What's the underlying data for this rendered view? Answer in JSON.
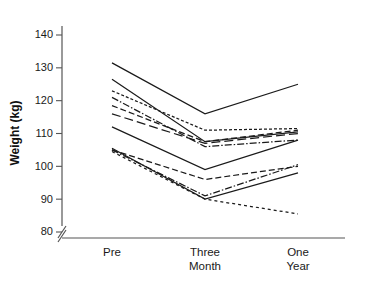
{
  "chart_data": {
    "type": "line",
    "title": "",
    "subtitle": "",
    "xlabel": "",
    "ylabel": "Weight (kg)",
    "categories": [
      "Pre",
      "Three Month",
      "One Year"
    ],
    "category_lines": [
      [
        "Pre"
      ],
      [
        "Three",
        "Month"
      ],
      [
        "One",
        "Year"
      ]
    ],
    "ylim": [
      80,
      145
    ],
    "yticks": [
      80,
      90,
      100,
      110,
      120,
      130,
      140
    ],
    "ytick_labels": [
      "80",
      "90",
      "100",
      "110",
      "120",
      "130",
      "140"
    ],
    "y_axis_break": true,
    "grid": false,
    "legend": false,
    "legend_position": "none",
    "line_color": "#1a1a1a",
    "background_color": "#ffffff",
    "series": [
      {
        "name": "subject-1",
        "style": "solid",
        "dash": "none",
        "values": [
          131.5,
          116.0,
          125.0
        ]
      },
      {
        "name": "subject-2",
        "style": "solid",
        "dash": "none",
        "values": [
          126.5,
          107.5,
          110.5
        ]
      },
      {
        "name": "subject-3",
        "style": "dotted",
        "dash": "3,2",
        "values": [
          123.0,
          111.0,
          111.5
        ]
      },
      {
        "name": "subject-4",
        "style": "dash-dot",
        "dash": "7,2,1.5,2",
        "values": [
          121.0,
          106.0,
          108.0
        ]
      },
      {
        "name": "subject-5",
        "style": "dashed",
        "dash": "6,3",
        "values": [
          118.5,
          107.5,
          111.0
        ]
      },
      {
        "name": "subject-6",
        "style": "dashed",
        "dash": "9,4",
        "values": [
          116.0,
          107.0,
          110.0
        ]
      },
      {
        "name": "subject-7",
        "style": "solid",
        "dash": "none",
        "values": [
          112.0,
          99.0,
          108.0
        ]
      },
      {
        "name": "subject-8",
        "style": "solid",
        "dash": "none",
        "values": [
          105.5,
          90.0,
          98.0
        ]
      },
      {
        "name": "subject-9",
        "style": "dashed",
        "dash": "6,3",
        "values": [
          105.0,
          96.0,
          100.0
        ]
      },
      {
        "name": "subject-10",
        "style": "dash-dot",
        "dash": "7,2,1.5,2",
        "values": [
          105.0,
          91.0,
          100.5
        ]
      },
      {
        "name": "subject-11",
        "style": "dotted",
        "dash": "3,3",
        "values": [
          104.5,
          90.0,
          85.5
        ]
      }
    ]
  },
  "axes": {
    "y_axis_label": "Weight (kg)"
  }
}
